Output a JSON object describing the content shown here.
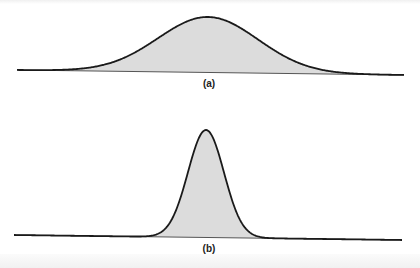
{
  "figure": {
    "panels": [
      {
        "label": "(a)",
        "description": "Wide bell-shaped (normal) curve with shaded area under it",
        "curve": {
          "center_x": 208,
          "peak_y": 17,
          "sigma": 50,
          "x_start": 17,
          "x_end": 404,
          "baseline_left_y": 70,
          "baseline_right_y": 75
        },
        "label_pos": {
          "x": 209,
          "y": 78
        }
      },
      {
        "label": "(b)",
        "description": "Narrow, tall bell-shaped (normal) curve with shaded area under it",
        "curve": {
          "center_x": 206,
          "peak_y": 130,
          "sigma": 18,
          "x_start": 14,
          "x_end": 402,
          "baseline_left_y": 235,
          "baseline_right_y": 240
        },
        "label_pos": {
          "x": 209,
          "y": 243
        }
      }
    ],
    "colors": {
      "fill": "#dcdcdc",
      "stroke": "#1a1a1a",
      "background": "#ffffff"
    }
  }
}
